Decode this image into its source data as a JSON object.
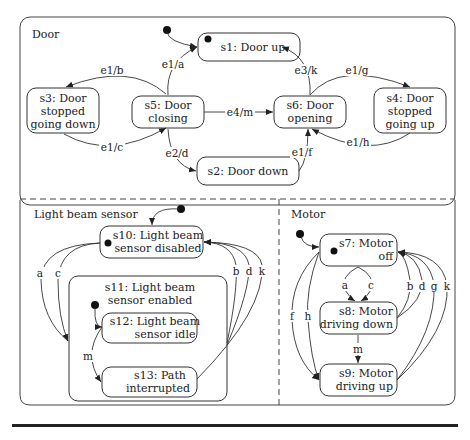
{
  "regions": {
    "door": "Door",
    "light": "Light beam sensor",
    "motor": "Motor"
  },
  "states": {
    "s1": [
      "s1: Door up"
    ],
    "s2": [
      "s2: Door down"
    ],
    "s3": [
      "s3: Door",
      "stopped",
      "going down"
    ],
    "s4": [
      "s4: Door",
      "stopped",
      "going up"
    ],
    "s5": [
      "s5: Door",
      "closing"
    ],
    "s6": [
      "s6: Door",
      "opening"
    ],
    "s7": [
      "s7: Motor",
      "off"
    ],
    "s8": [
      "s8: Motor",
      "driving down"
    ],
    "s9": [
      "s9: Motor",
      "driving up"
    ],
    "s10": [
      "s10: Light beam",
      "sensor disabled"
    ],
    "s11": [
      "s11: Light beam",
      "sensor enabled"
    ],
    "s12": [
      "s12: Light beam",
      "sensor idle"
    ],
    "s13": [
      "s13: Path",
      "interrupted"
    ]
  },
  "transitions": {
    "e1a": "e1/a",
    "e1b": "e1/b",
    "e1c": "e1/c",
    "e2d": "e2/d",
    "e4m": "e4/m",
    "e3k": "e3/k",
    "e1g": "e1/g",
    "e1h": "e1/h",
    "e1f": "e1/f",
    "a": "a",
    "b": "b",
    "c": "c",
    "d": "d",
    "f": "f",
    "g": "g",
    "h": "h",
    "k": "k",
    "m": "m"
  }
}
